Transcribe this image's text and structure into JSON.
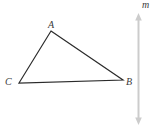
{
  "figure": {
    "labels": {
      "vertex_a": "A",
      "vertex_b": "B",
      "vertex_c": "C",
      "line_m": "m"
    },
    "colors": {
      "triangle_stroke": "#2b2b2b",
      "line_m": "#cccccc",
      "label_text": "#3a3a3a",
      "background": "#ffffff"
    }
  }
}
